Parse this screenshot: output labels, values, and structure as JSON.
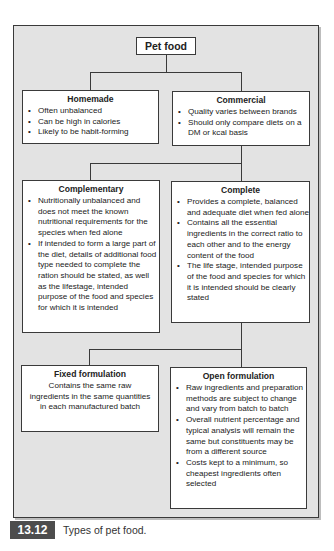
{
  "diagram": {
    "root": {
      "title": "Pet food"
    },
    "level1": [
      {
        "title": "Homemade",
        "bullets": [
          "Often unbalanced",
          "Can be high in calories",
          "Likely to be habit-forming"
        ]
      },
      {
        "title": "Commercial",
        "bullets": [
          "Quality varies between brands",
          "Should only compare diets on a DM or kcal basis"
        ]
      }
    ],
    "level2": [
      {
        "title": "Complementary",
        "bullets": [
          "Nutritionally unbalanced and does not meet the known nutritional requirements for the species when fed alone",
          "If intended to form a large part of the diet, details of additional food type needed to complete the ration should be stated, as well as the lifestage, intended purpose of the food and species for which it is intended"
        ]
      },
      {
        "title": "Complete",
        "bullets": [
          "Provides a complete, balanced and adequate diet when fed alone",
          "Contains all the essential ingredients in the correct ratio to each other and to the energy content of the food",
          "The life stage, intended purpose of the food and species for which it is intended should be clearly stated"
        ]
      }
    ],
    "level3": [
      {
        "title": "Fixed formulation",
        "text": "Contains the same raw ingredients in the same quantities in each manufactured batch"
      },
      {
        "title": "Open formulation",
        "bullets": [
          "Raw ingredients and preparation methods are subject to change and vary from batch to batch",
          "Overall nutrient percentage and typical analysis will remain the same but constituents may be from a different source",
          "Costs kept to a minimum, so cheapest ingredients often selected"
        ]
      }
    ]
  },
  "figure": {
    "number": "13.12",
    "caption": "Types of pet food."
  },
  "colors": {
    "panel_bg": "#e3e3e3",
    "border": "#3a3a3a",
    "label_bg": "#4d4d4d"
  }
}
